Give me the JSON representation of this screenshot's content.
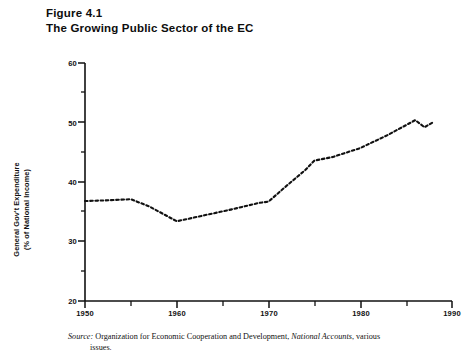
{
  "figure": {
    "number_label": "Figure 4.1",
    "title": "The Growing Public Sector of the EC"
  },
  "axis": {
    "y_title_line1": "General Gov't Expenditure",
    "y_title_line2": "(% of National Income)",
    "y_ticks": [
      "60",
      "50",
      "40",
      "30",
      "20"
    ],
    "x_ticks": [
      "1950",
      "1960",
      "1970",
      "1980",
      "1990"
    ]
  },
  "source": {
    "lead": "Source:",
    "text_before_italic": " Organization for Economic Cooperation and Development, ",
    "italic": "National Accounts",
    "text_after_italic": ", various",
    "second_line": "issues."
  },
  "chart_data": {
    "type": "line",
    "title": "The Growing Public Sector of the EC",
    "subtitle": "Figure 4.1",
    "xlabel": "",
    "ylabel": "General Gov't Expenditure (% of National Income)",
    "xlim": [
      1950,
      1990
    ],
    "ylim": [
      20,
      60
    ],
    "x_major_ticks": [
      1950,
      1960,
      1970,
      1980,
      1990
    ],
    "x_minor_ticks": [
      1955,
      1965,
      1975,
      1985
    ],
    "y_major_ticks": [
      20,
      30,
      40,
      50,
      60
    ],
    "y_minor_ticks": [
      25,
      35,
      45,
      55
    ],
    "grid": false,
    "legend": false,
    "line_style": "dotted",
    "line_color": "#111111",
    "series": [
      {
        "name": "General Gov't Expenditure (% of National Income)",
        "x": [
          1950,
          1952,
          1955,
          1957,
          1960,
          1963,
          1966,
          1969,
          1970,
          1972,
          1974,
          1975,
          1977,
          1980,
          1983,
          1986,
          1987,
          1988
        ],
        "values": [
          36.8,
          36.9,
          37.1,
          35.9,
          33.4,
          34.4,
          35.4,
          36.5,
          36.7,
          39.4,
          42.0,
          43.6,
          44.2,
          45.7,
          47.9,
          50.4,
          49.2,
          50.1
        ]
      }
    ]
  }
}
